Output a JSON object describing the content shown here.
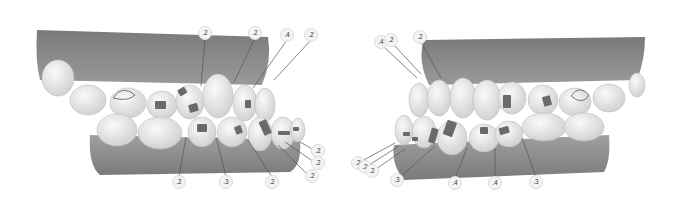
{
  "figure": {
    "colors": {
      "gum": "#8c8c8c",
      "gum_dark": "#6e6e6e",
      "tooth": "#ececec",
      "tooth_shade": "#cfcfcf",
      "attachment": "#6a6a6a",
      "leader": "#555555"
    }
  },
  "views": [
    {
      "name": "right-lateral-view",
      "labels": [
        {
          "text": ".2",
          "x": 205,
          "y": 33
        },
        {
          "text": ".2",
          "x": 255,
          "y": 33
        },
        {
          "text": ".4",
          "x": 287,
          "y": 35
        },
        {
          "text": ".2",
          "x": 311,
          "y": 35
        },
        {
          "text": ".2",
          "x": 318,
          "y": 151
        },
        {
          "text": ".2",
          "x": 318,
          "y": 163
        },
        {
          "text": ".2",
          "x": 312,
          "y": 176
        },
        {
          "text": ".2",
          "x": 179,
          "y": 182
        },
        {
          "text": ".3",
          "x": 226,
          "y": 182
        },
        {
          "text": ".2",
          "x": 272,
          "y": 182
        }
      ]
    },
    {
      "name": "left-lateral-view",
      "labels": [
        {
          "text": ".4",
          "x": 42,
          "y": 42
        },
        {
          "text": ".2",
          "x": 52,
          "y": 40
        },
        {
          "text": ".2",
          "x": 81,
          "y": 37
        },
        {
          "text": ".2",
          "x": 19,
          "y": 163
        },
        {
          "text": ".2",
          "x": 26,
          "y": 167
        },
        {
          "text": ".2",
          "x": 33,
          "y": 171
        },
        {
          "text": ".3",
          "x": 58,
          "y": 180
        },
        {
          "text": ".4",
          "x": 116,
          "y": 183
        },
        {
          "text": ".4",
          "x": 156,
          "y": 183
        },
        {
          "text": ".3",
          "x": 197,
          "y": 182
        }
      ]
    }
  ]
}
